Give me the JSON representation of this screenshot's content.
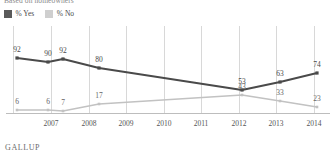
{
  "subtitle": "Based on homeowners",
  "footer": "GALLUP",
  "colors": {
    "yes": "#4a4a4a",
    "no": "#c2c2c2",
    "grid": "#d8d8d8",
    "axis": "#bdbdbd",
    "text": "#4a4a4a"
  },
  "legend": {
    "items": [
      {
        "label": "% Yes",
        "key": "yes",
        "color": "#5a5a5a"
      },
      {
        "label": "% No",
        "key": "no",
        "color": "#cfcfcf"
      }
    ]
  },
  "chart_data": {
    "type": "line",
    "title": "",
    "subtitle": "Based on homeowners",
    "xlabel": "",
    "ylabel": "",
    "ylim": [
      0,
      100
    ],
    "grid": true,
    "legend_position": "top-left",
    "source": "GALLUP",
    "categories": [
      "2006",
      "2007",
      "2008",
      "2009",
      "2010",
      "2011",
      "2012",
      "2013",
      "2014"
    ],
    "tick_labels": [
      "",
      "2007",
      "2008",
      "2009",
      "2010",
      "2011",
      "2012",
      "2013",
      "2014"
    ],
    "series": [
      {
        "name": "% Yes",
        "color": "#4a4a4a",
        "points": [
          {
            "x": "2006",
            "value": 92,
            "label": "92",
            "px": 17,
            "py": 58
          },
          {
            "x": "2007",
            "value": 90,
            "label": "90",
            "px": 48,
            "py": 62
          },
          {
            "x": "2007b",
            "value": 92,
            "label": "92",
            "px": 63,
            "py": 59
          },
          {
            "x": "2008",
            "value": 80,
            "label": "80",
            "px": 99,
            "py": 68
          },
          {
            "x": "2012",
            "value": 53,
            "label": "53",
            "px": 242,
            "py": 90
          },
          {
            "x": "2013",
            "value": 63,
            "label": "63",
            "px": 280,
            "py": 82
          },
          {
            "x": "2014",
            "value": 74,
            "label": "74",
            "px": 317,
            "py": 73
          }
        ]
      },
      {
        "name": "% No",
        "color": "#c2c2c2",
        "points": [
          {
            "x": "2006",
            "value": 6,
            "label": "6",
            "px": 17,
            "py": 110
          },
          {
            "x": "2007",
            "value": 6,
            "label": "6",
            "px": 48,
            "py": 110
          },
          {
            "x": "2007b",
            "value": 7,
            "label": "7",
            "px": 63,
            "py": 111
          },
          {
            "x": "2008",
            "value": 17,
            "label": "17",
            "px": 99,
            "py": 104
          },
          {
            "x": "2012",
            "value": 43,
            "label": "43",
            "px": 242,
            "py": 95
          },
          {
            "x": "2013",
            "value": 33,
            "label": "33",
            "px": 280,
            "py": 101
          },
          {
            "x": "2014",
            "value": 23,
            "label": "23",
            "px": 317,
            "py": 107
          }
        ]
      }
    ]
  },
  "axis": {
    "ticks": [
      {
        "label": "",
        "px": 13
      },
      {
        "label": "2007",
        "px": 51
      },
      {
        "label": "2008",
        "px": 89
      },
      {
        "label": "2009",
        "px": 126
      },
      {
        "label": "2010",
        "px": 164
      },
      {
        "label": "2011",
        "px": 201
      },
      {
        "label": "2012",
        "px": 239
      },
      {
        "label": "2013",
        "px": 276
      },
      {
        "label": "2014",
        "px": 314
      }
    ],
    "gridlines_px": [
      13,
      51,
      89,
      126,
      164,
      201,
      239,
      276,
      314
    ],
    "baseline_py": 113
  }
}
